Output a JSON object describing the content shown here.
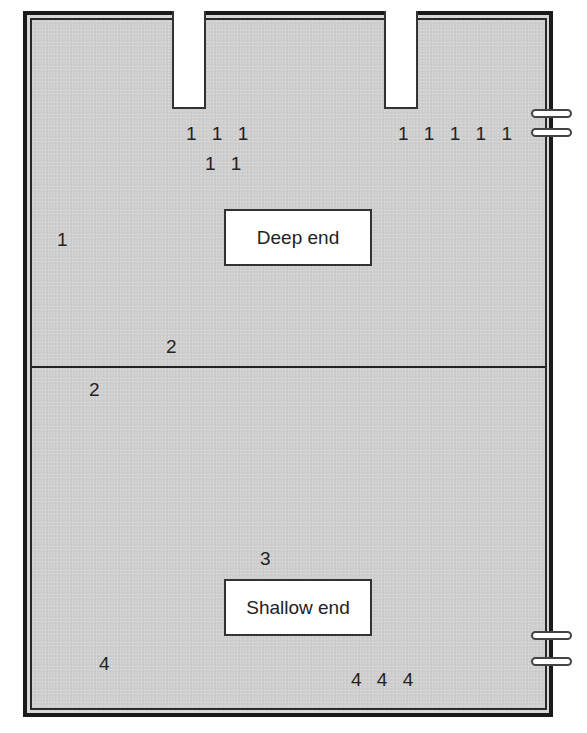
{
  "diagram": {
    "zones": {
      "deep_end": {
        "label": "Deep end"
      },
      "shallow_end": {
        "label": "Shallow end"
      }
    },
    "diving_boards": [
      {
        "id": "board-left"
      },
      {
        "id": "board-right"
      }
    ],
    "ladders": [
      {
        "id": "ladder-top-right",
        "rungs": 2
      },
      {
        "id": "ladder-bottom-right",
        "rungs": 2
      }
    ],
    "markers": [
      {
        "text": "1 1 1",
        "zone": "deep",
        "position": "below left diving board, row 1"
      },
      {
        "text": "1 1",
        "zone": "deep",
        "position": "below left diving board, row 2"
      },
      {
        "text": "1 1 1 1 1",
        "zone": "deep",
        "position": "below right diving board"
      },
      {
        "text": "1",
        "zone": "deep",
        "position": "left side"
      },
      {
        "text": "2",
        "zone": "deep",
        "position": "just above divider"
      },
      {
        "text": "2",
        "zone": "shallow",
        "position": "just below divider, left"
      },
      {
        "text": "3",
        "zone": "shallow",
        "position": "above Shallow end label"
      },
      {
        "text": "4",
        "zone": "shallow",
        "position": "bottom left"
      },
      {
        "text": "4 4 4",
        "zone": "shallow",
        "position": "bottom center-right"
      }
    ],
    "colors": {
      "water": "#cfcfcf",
      "border": "#1a1a1a",
      "label_background": "#ffffff",
      "text": "#222222"
    }
  }
}
